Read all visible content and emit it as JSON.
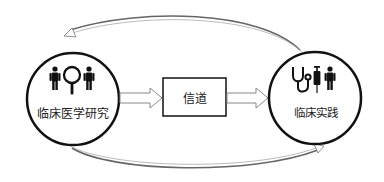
{
  "diagram": {
    "nodes": [
      {
        "id": "research",
        "label": "临床医学研究",
        "shape": "circle",
        "icons": [
          "person-icon",
          "magnifier-icon",
          "person-icon"
        ]
      },
      {
        "id": "channel",
        "label": "信道",
        "shape": "rectangle"
      },
      {
        "id": "practice",
        "label": "临床实践",
        "shape": "circle",
        "icons": [
          "stethoscope-icon",
          "syringe-icon",
          "person-icon"
        ]
      }
    ],
    "edges": [
      {
        "from": "research",
        "to": "channel",
        "style": "block-arrow"
      },
      {
        "from": "channel",
        "to": "practice",
        "style": "block-arrow"
      },
      {
        "from": "practice",
        "to": "research",
        "style": "curved-arrow-top"
      },
      {
        "from": "research",
        "to": "practice",
        "style": "curved-arrow-bottom"
      }
    ],
    "colors": {
      "stroke": "#111111",
      "arrow": "#888888",
      "background": "#ffffff"
    }
  }
}
